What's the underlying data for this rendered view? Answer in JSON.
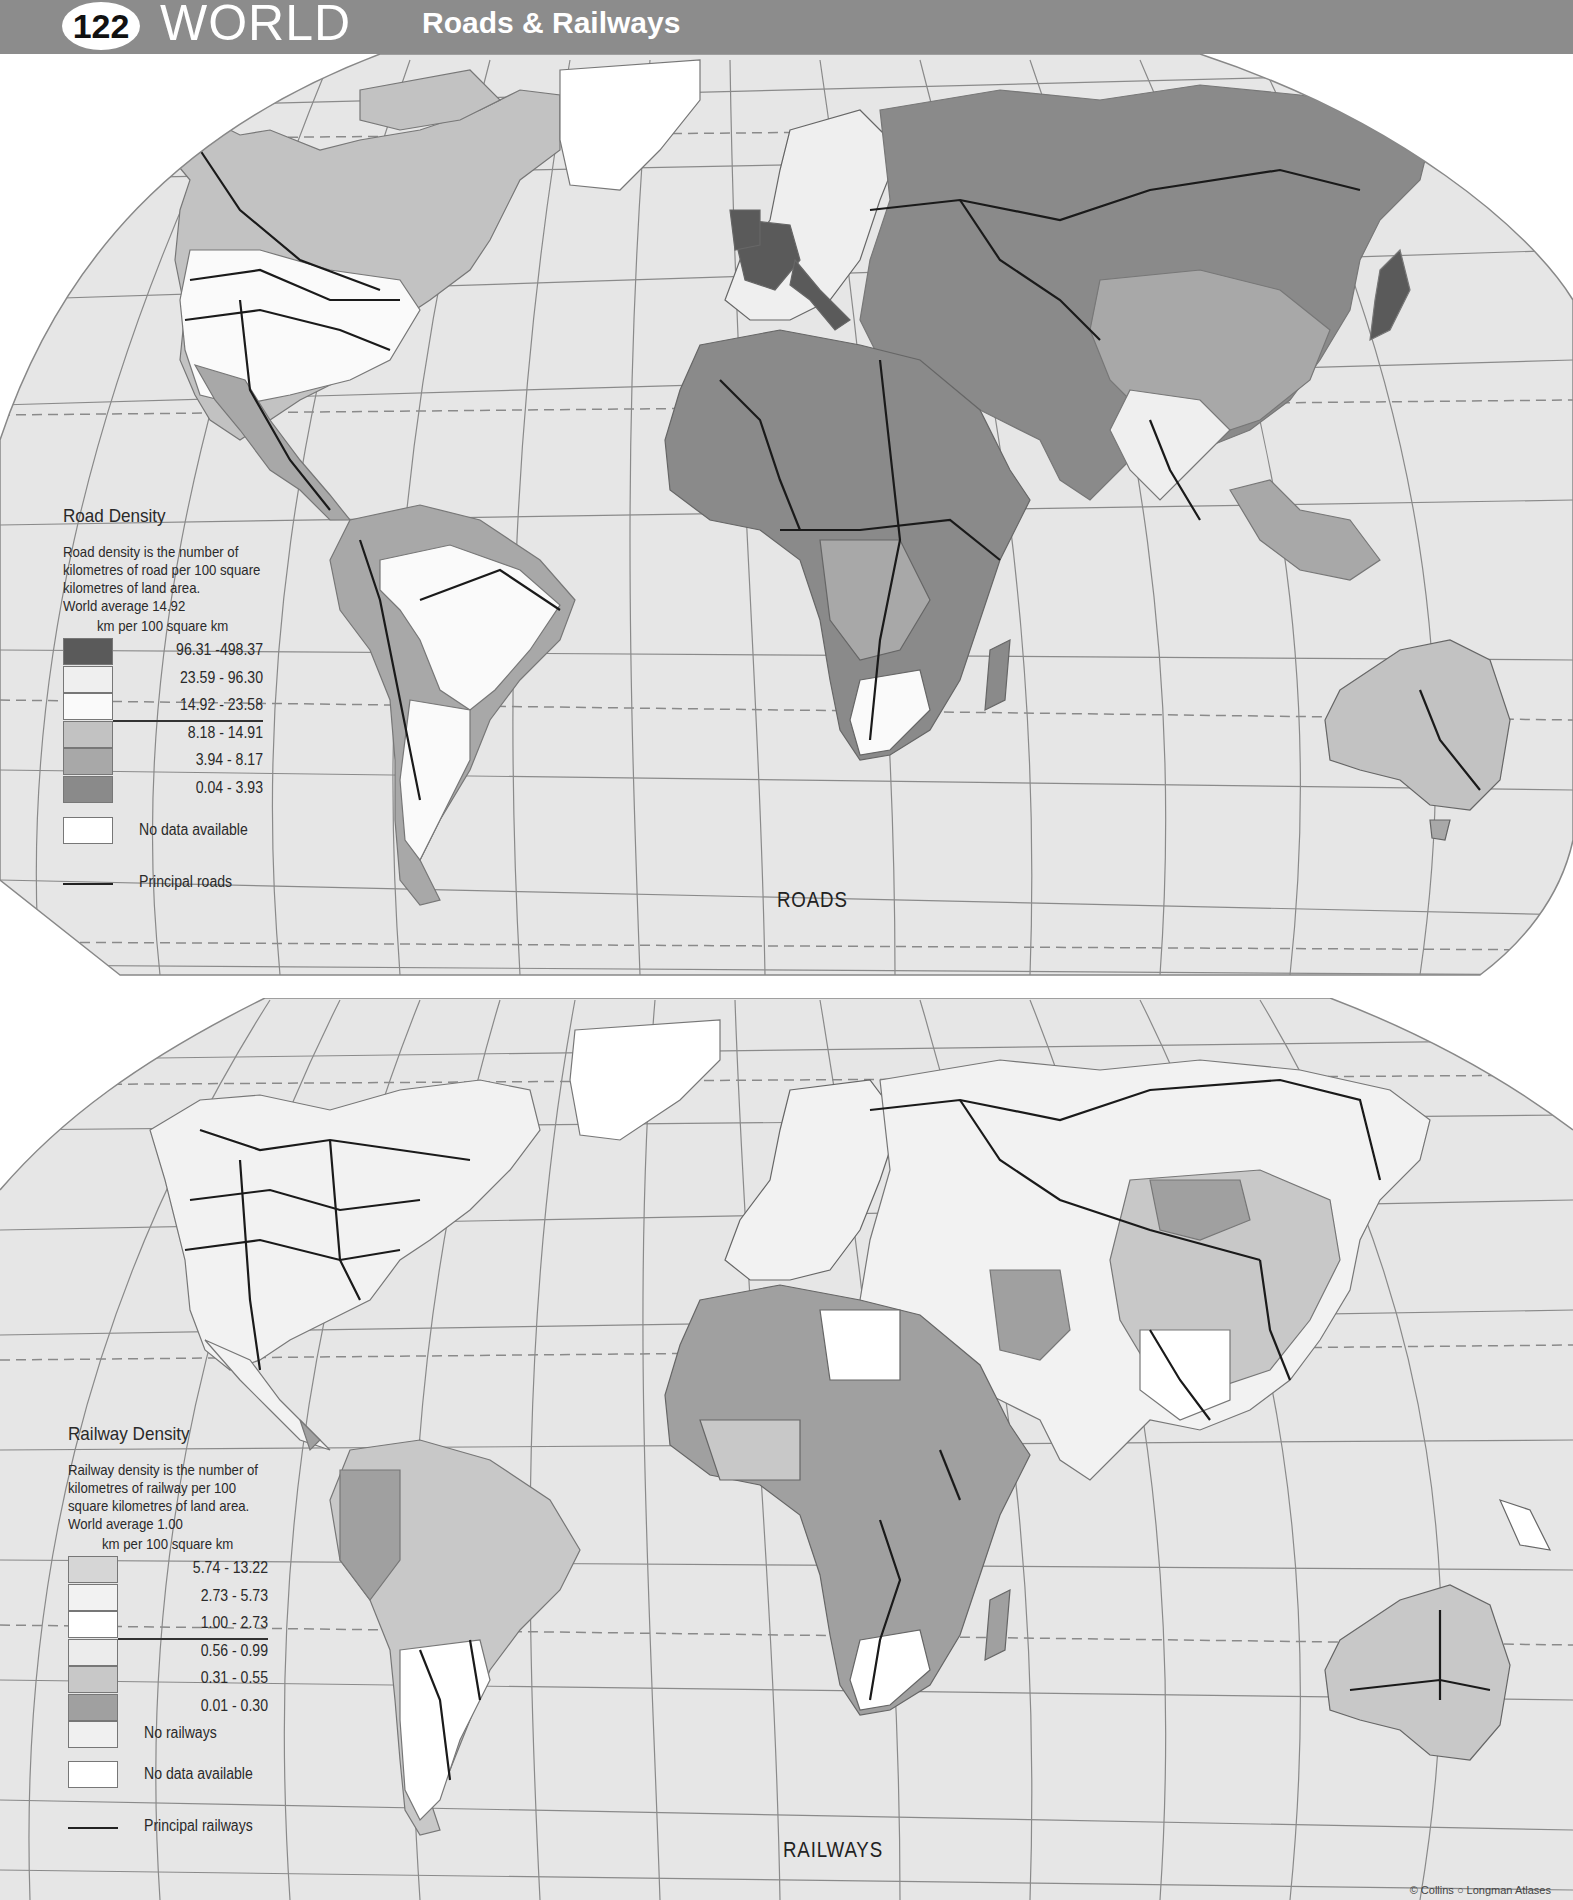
{
  "header": {
    "page_number": "122",
    "title": "WORLD",
    "subtitle": "Roads & Railways",
    "bar_color": "#8c8c8c"
  },
  "colors": {
    "ocean": "#e6e6e6",
    "graticule": "#8a8a8a",
    "route_line": "#1a1a1a",
    "no_data": "#ffffff"
  },
  "roads_map": {
    "label": "ROADS",
    "legend": {
      "title": "Road Density",
      "description": "Road density is the number of kilometres of road per 100 square kilometres of land area.",
      "world_average": "World average 14.92",
      "units": "km per 100 square km",
      "classes": [
        {
          "range": "96.31 -498.37",
          "color": "#5a5a5a"
        },
        {
          "range": "23.59 -  96.30",
          "color": "#efefef"
        },
        {
          "range": "14.92 -  23.58",
          "color": "#fafafa"
        },
        {
          "range": "8.18 -  14.91",
          "color": "#c2c2c2"
        },
        {
          "range": "3.94 -   8.17",
          "color": "#a8a8a8"
        },
        {
          "range": "0.04 -   3.93",
          "color": "#8a8a8a"
        }
      ],
      "no_data_label": "No data available",
      "line_label": "Principal roads"
    }
  },
  "railways_map": {
    "label": "RAILWAYS",
    "legend": {
      "title": "Railway Density",
      "description": "Railway density is the number of kilometres of railway per 100 square kilometres of land area.",
      "world_average": "World average 1.00",
      "units": "km per 100 square km",
      "classes": [
        {
          "range": "5.74 - 13.22",
          "color": "#d6d6d6"
        },
        {
          "range": "2.73 -   5.73",
          "color": "#f2f2f2"
        },
        {
          "range": "1.00 -   2.73",
          "color": "#ffffff"
        },
        {
          "range": "0.56 -   0.99",
          "color": "#ececec"
        },
        {
          "range": "0.31 -   0.55",
          "color": "#c8c8c8"
        },
        {
          "range": "0.01 -   0.30",
          "color": "#a0a0a0"
        }
      ],
      "no_railways_label": "No railways",
      "no_railways_color": "#f0f0f0",
      "no_data_label": "No data available",
      "line_label": "Principal railways"
    }
  },
  "credit": "© Collins ○ Longman Atlases"
}
